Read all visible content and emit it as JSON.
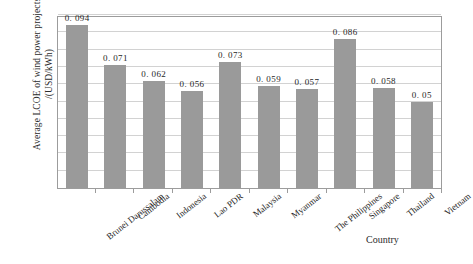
{
  "chart_data": {
    "type": "bar",
    "title": "",
    "xlabel": "Country",
    "ylabel": "Average LCOE of wind power projects /(USD/kWh)",
    "ylabel_line1": "Average LCOE of wind power projects",
    "ylabel_line2": "/(USD/kWh)",
    "ylim": [
      0,
      0.1
    ],
    "grid": true,
    "gridline_interval": 0.01,
    "legend": "none",
    "tick_labels_y": [],
    "bar_color": "#9a9a9a",
    "categories": [
      "Brunei Darussalam",
      "Cambodia",
      "Indonesia",
      "Lao PDR",
      "Malaysia",
      "Myanmar",
      "The Philippines",
      "Singapore",
      "Thailand",
      "Vietnam"
    ],
    "values": [
      0.094,
      0.071,
      0.062,
      0.056,
      0.073,
      0.059,
      0.057,
      0.086,
      0.058,
      0.05
    ],
    "value_labels": [
      "0. 094",
      "0. 071",
      "0. 062",
      "0. 056",
      "0. 073",
      "0. 059",
      "0. 057",
      "0. 086",
      "0. 058",
      "0. 05"
    ]
  }
}
